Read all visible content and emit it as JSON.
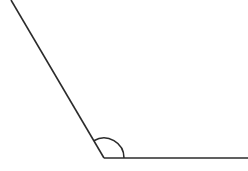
{
  "figure": {
    "kind": "geometry-angle-diagram",
    "background_color": "#ffffff",
    "stroke_color": "#2b2b2b",
    "stroke_width": 1.6,
    "canvas": {
      "width": 248,
      "height": 171
    },
    "vertex": {
      "x": 104,
      "y": 158,
      "label": ""
    },
    "rays": [
      {
        "name": "diagonal-ray",
        "from": {
          "x": 104,
          "y": 158
        },
        "to": {
          "x": 11,
          "y": 0
        },
        "direction_degrees": 120.5,
        "label": ""
      },
      {
        "name": "horizontal-ray",
        "from": {
          "x": 104,
          "y": 158
        },
        "to": {
          "x": 248,
          "y": 158
        },
        "direction_degrees": 0,
        "label": ""
      }
    ],
    "angle_arc": {
      "name": "interior-angle-arc",
      "radius": 20,
      "start_degrees": 0,
      "end_degrees": 120.5,
      "measure_label": "",
      "path": "M 124 158 A 20 20 0 0 0 93.85 141.72"
    }
  }
}
